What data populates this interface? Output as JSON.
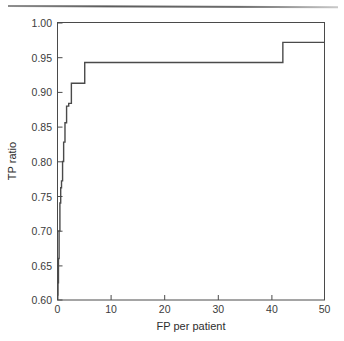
{
  "figure": {
    "top_rule": "horizontal-rule",
    "background_color": "#ffffff",
    "line_color": "#4a4a4a"
  },
  "chart_data": {
    "type": "line",
    "title": "",
    "subtitle": "",
    "xlabel": "FP per patient",
    "ylabel": "TP ratio",
    "xlim": [
      0,
      50
    ],
    "ylim": [
      0.6,
      1.0
    ],
    "xticks": [
      0,
      10,
      20,
      30,
      40,
      50
    ],
    "xtick_labels": [
      "0",
      "10",
      "20",
      "30",
      "40",
      "50"
    ],
    "yticks": [
      0.6,
      0.65,
      0.7,
      0.75,
      0.8,
      0.85,
      0.9,
      0.95,
      1.0
    ],
    "ytick_labels": [
      "0.60",
      "0.65",
      "0.70",
      "0.75",
      "0.80",
      "0.85",
      "0.90",
      "0.95",
      "1.00"
    ],
    "grid": false,
    "legend": null,
    "drawstyle": "steps-post",
    "series": [
      {
        "name": "FROC curve",
        "color": "#4a4a4a",
        "x": [
          0.05,
          0.1,
          0.18,
          0.3,
          0.45,
          0.6,
          0.75,
          0.95,
          1.15,
          1.4,
          1.7,
          2.1,
          2.6,
          5.1,
          42.2,
          50.0
        ],
        "y": [
          0.607,
          0.625,
          0.66,
          0.7,
          0.74,
          0.762,
          0.772,
          0.8,
          0.828,
          0.856,
          0.88,
          0.884,
          0.913,
          0.943,
          0.972,
          0.972
        ]
      }
    ],
    "annotations": [
      "steep rise from 0.61 to 0.91 within the first 3 FP per patient",
      "plateau at 0.943 between about 5 and 42 FP per patient",
      "final step to 0.972 at about 42 FP per patient"
    ]
  }
}
